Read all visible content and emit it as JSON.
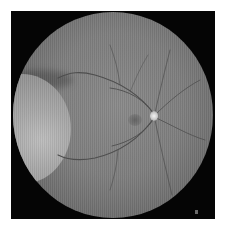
{
  "image": {
    "subject": "retinal fundus photograph",
    "color_mode": "grayscale",
    "colors": {
      "frame_background": "#050505",
      "page_background": "#ffffff",
      "fundus_center": "#8a8a8a",
      "fundus_edge": "#4a4a4a",
      "optic_disc": "#f2f2f2",
      "vessels": "#4e4e4e"
    },
    "features": [
      "fundus-circle",
      "optic-disc",
      "macula",
      "blood-vessels",
      "left-lens-flare"
    ]
  }
}
